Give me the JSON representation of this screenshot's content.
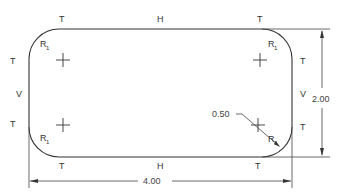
{
  "drawing": {
    "type": "rounded-rectangle-plate",
    "colors": {
      "line": "#333333",
      "text": "#333333",
      "background": "#ffffff"
    },
    "tangent_labels": [
      "T",
      "T",
      "T",
      "T",
      "T",
      "T",
      "T",
      "T"
    ],
    "horizontal_labels": [
      "H",
      "H"
    ],
    "vertical_labels": [
      "V",
      "V"
    ],
    "radius_labels": [
      {
        "main": "R",
        "sub": "1"
      },
      {
        "main": "R",
        "sub": "1"
      },
      {
        "main": "R",
        "sub": "1"
      },
      {
        "main": "R",
        "sub": "1"
      }
    ],
    "dimensions": {
      "width": "4.00",
      "height": "2.00",
      "radius_callout": "0.50"
    },
    "center_marks": 4
  }
}
